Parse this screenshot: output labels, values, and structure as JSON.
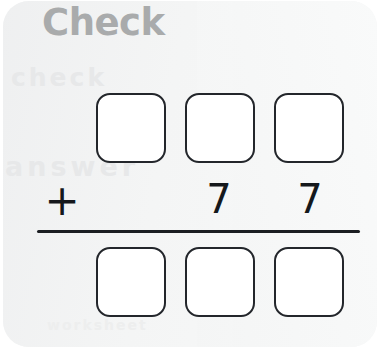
{
  "page": {
    "title": "Check",
    "background_color": "#ffffff",
    "card_color": "#f3f4f4",
    "heading_color": "#a9abac",
    "ink_color": "#1b1e22"
  },
  "problem": {
    "type": "vertical-addition",
    "operator": "+",
    "addend_top": {
      "hundreds": "",
      "tens": "",
      "ones": ""
    },
    "addend_bottom": {
      "hundreds": "",
      "tens": "7",
      "ones": "7"
    },
    "sum": {
      "hundreds": "",
      "tens": "",
      "ones": ""
    },
    "top_row_boxes": [
      "",
      "",
      ""
    ],
    "bottom_row_boxes": [
      "",
      "",
      ""
    ],
    "digit_row": [
      "",
      "7",
      "7"
    ]
  },
  "bleed_through": {
    "line_1": "check",
    "line_2": "answer",
    "line_3": "worksheet"
  }
}
